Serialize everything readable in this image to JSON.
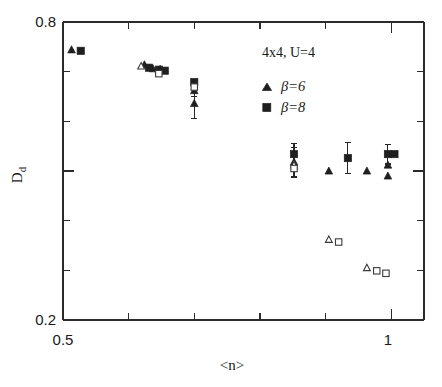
{
  "chart_data": {
    "type": "scatter",
    "title": "",
    "xlabel": "<n>",
    "ylabel": "D_d",
    "xlim": [
      0.5,
      1.05
    ],
    "ylim": [
      0.2,
      0.8
    ],
    "xticks": [
      0.5,
      0.6,
      0.7,
      0.8,
      0.9,
      1.0
    ],
    "xtick_labels": [
      "0.5",
      "",
      "",
      "",
      "",
      "1"
    ],
    "yticks": [
      0.2,
      0.3,
      0.4,
      0.5,
      0.6,
      0.7,
      0.8
    ],
    "ytick_labels": [
      "0.2",
      "",
      "",
      "",
      "",
      "",
      "0.8"
    ],
    "grid": false,
    "annotation": "4x4, U=4",
    "legend_position": "top-right",
    "series": [
      {
        "name": "beta=6",
        "label": "β=6",
        "marker": "triangle",
        "fill": "filled",
        "points": [
          {
            "x": 0.513,
            "y": 0.744,
            "yerr": 0.0
          },
          {
            "x": 0.624,
            "y": 0.714,
            "yerr": 0.0
          },
          {
            "x": 0.637,
            "y": 0.706,
            "yerr": 0.0
          },
          {
            "x": 0.648,
            "y": 0.705,
            "yerr": 0.0
          },
          {
            "x": 0.7,
            "y": 0.636,
            "yerr": 0.03
          },
          {
            "x": 0.7,
            "y": 0.662,
            "yerr": 0.012
          },
          {
            "x": 0.852,
            "y": 0.518,
            "yerr": 0.03
          },
          {
            "x": 0.905,
            "y": 0.5,
            "yerr": 0.0
          },
          {
            "x": 0.963,
            "y": 0.5,
            "yerr": 0.0
          },
          {
            "x": 0.995,
            "y": 0.49,
            "yerr": 0.0
          },
          {
            "x": 0.995,
            "y": 0.512,
            "yerr": 0.0
          }
        ]
      },
      {
        "name": "beta=8",
        "label": "β=8",
        "marker": "square",
        "fill": "filled",
        "points": [
          {
            "x": 0.527,
            "y": 0.742,
            "yerr": 0.0
          },
          {
            "x": 0.631,
            "y": 0.708,
            "yerr": 0.0
          },
          {
            "x": 0.646,
            "y": 0.704,
            "yerr": 0.0
          },
          {
            "x": 0.655,
            "y": 0.702,
            "yerr": 0.0
          },
          {
            "x": 0.7,
            "y": 0.679,
            "yerr": 0.0
          },
          {
            "x": 0.852,
            "y": 0.534,
            "yerr": 0.022
          },
          {
            "x": 0.934,
            "y": 0.526,
            "yerr": 0.031
          },
          {
            "x": 0.995,
            "y": 0.534,
            "yerr": 0.02
          },
          {
            "x": 1.005,
            "y": 0.534,
            "yerr": 0.0
          }
        ]
      },
      {
        "name": "beta=6-open",
        "label": "β=6",
        "marker": "triangle",
        "fill": "open",
        "points": [
          {
            "x": 0.619,
            "y": 0.711,
            "yerr": 0.0
          },
          {
            "x": 0.852,
            "y": 0.512,
            "yerr": 0.0
          },
          {
            "x": 0.905,
            "y": 0.362,
            "yerr": 0.0
          },
          {
            "x": 0.963,
            "y": 0.305,
            "yerr": 0.0
          }
        ]
      },
      {
        "name": "beta=8-open",
        "label": "β=8",
        "marker": "square",
        "fill": "open",
        "points": [
          {
            "x": 0.646,
            "y": 0.696,
            "yerr": 0.0
          },
          {
            "x": 0.7,
            "y": 0.669,
            "yerr": 0.0
          },
          {
            "x": 0.852,
            "y": 0.505,
            "yerr": 0.0
          },
          {
            "x": 0.92,
            "y": 0.357,
            "yerr": 0.0
          },
          {
            "x": 0.978,
            "y": 0.299,
            "yerr": 0.0
          },
          {
            "x": 0.992,
            "y": 0.294,
            "yerr": 0.0
          }
        ]
      }
    ]
  },
  "axes": {
    "x_label": "<n>",
    "y_label_main": "D",
    "y_label_sub": "d",
    "x_min_label": "0.5",
    "x_max_label": "1",
    "y_min_label": "0.2",
    "y_max_label": "0.8"
  },
  "legend": {
    "header": "4x4, U=4",
    "entries": [
      {
        "label": "β=6",
        "marker": "triangle"
      },
      {
        "label": "β=8",
        "marker": "square"
      }
    ]
  },
  "colors": {
    "marker": "#1f1f1f",
    "axis": "#2b2b2b",
    "background": "#ffffff"
  }
}
